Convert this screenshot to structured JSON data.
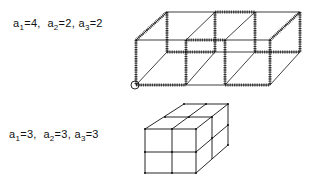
{
  "figures": [
    {
      "id": "box-4-2-2",
      "label_parts": [
        {
          "var": "a",
          "sub": "1",
          "val": "4"
        },
        {
          "var": "a",
          "sub": "2",
          "val": "2"
        },
        {
          "var": "a",
          "sub": "3",
          "val": "2"
        }
      ],
      "separator": ", ",
      "description": "Box of 3 cells front, partially hatched edges, origin circled"
    },
    {
      "id": "box-3-3-3",
      "label_parts": [
        {
          "var": "a",
          "sub": "1",
          "val": "3"
        },
        {
          "var": "a",
          "sub": "2",
          "val": "3"
        },
        {
          "var": "a",
          "sub": "3",
          "val": "3"
        }
      ],
      "separator": ", ",
      "description": "Cube of 2x2x2 cells"
    }
  ],
  "colors": {
    "ink": "#111111",
    "background": "#ffffff"
  }
}
